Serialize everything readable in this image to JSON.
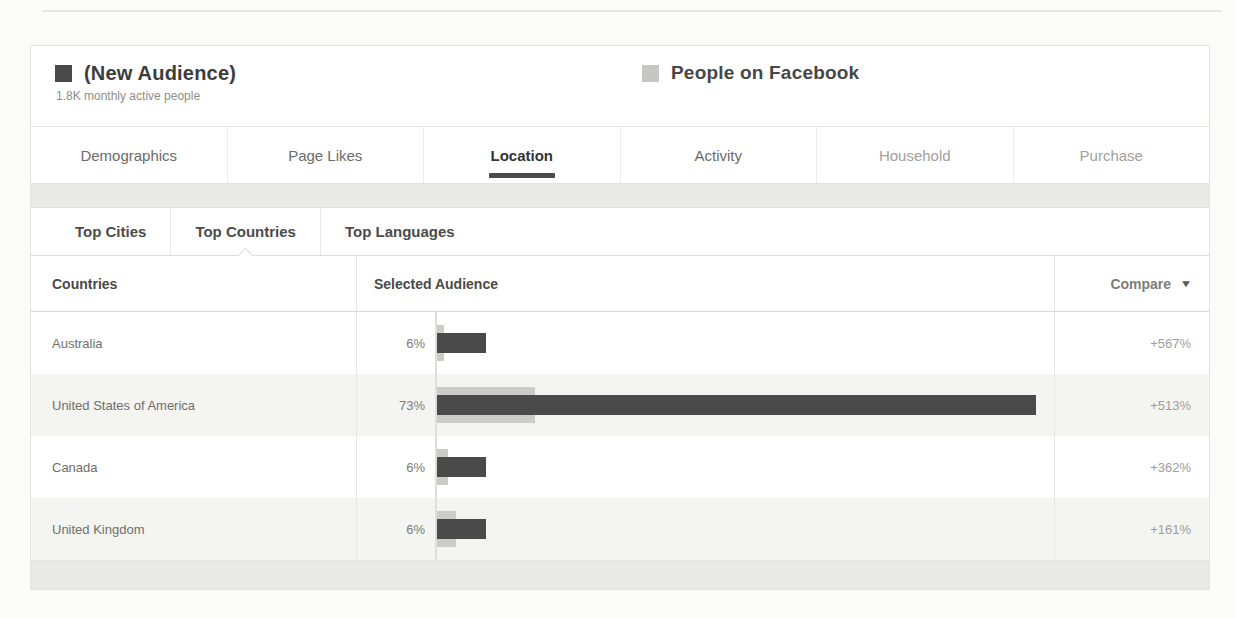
{
  "legend": {
    "audience": {
      "label": "(New Audience)",
      "sublabel": "1.8K monthly active people",
      "color": "#4a4a4a"
    },
    "facebook": {
      "label": "People on Facebook",
      "color": "#c6c6c2"
    }
  },
  "tabs": [
    {
      "label": "Demographics",
      "tone": "normal"
    },
    {
      "label": "Page Likes",
      "tone": "normal"
    },
    {
      "label": "Location",
      "tone": "active"
    },
    {
      "label": "Activity",
      "tone": "normal"
    },
    {
      "label": "Household",
      "tone": "muted"
    },
    {
      "label": "Purchase",
      "tone": "muted"
    }
  ],
  "subtabs": [
    {
      "label": "Top Cities",
      "active": false
    },
    {
      "label": "Top Countries",
      "active": true
    },
    {
      "label": "Top Languages",
      "active": false
    }
  ],
  "table": {
    "columns": {
      "country": "Countries",
      "audience": "Selected Audience",
      "compare": "Compare"
    },
    "compare_caret": "▼"
  },
  "rows": [
    {
      "country": "Australia",
      "pct_label": "6%",
      "audience_pct": 6,
      "facebook_pct": 0.9,
      "compare": "+567%"
    },
    {
      "country": "United States of America",
      "pct_label": "73%",
      "audience_pct": 73,
      "facebook_pct": 11.9,
      "compare": "+513%"
    },
    {
      "country": "Canada",
      "pct_label": "6%",
      "audience_pct": 6,
      "facebook_pct": 1.3,
      "compare": "+362%"
    },
    {
      "country": "United Kingdom",
      "pct_label": "6%",
      "audience_pct": 6,
      "facebook_pct": 2.3,
      "compare": "+161%"
    }
  ],
  "chart_data": {
    "type": "bar",
    "categories": [
      "Australia",
      "United States of America",
      "Canada",
      "United Kingdom"
    ],
    "series": [
      {
        "name": "(New Audience)",
        "values": [
          6,
          73,
          6,
          6
        ],
        "color": "#4a4a4a"
      },
      {
        "name": "People on Facebook",
        "values": [
          0.9,
          11.9,
          1.3,
          2.3
        ],
        "color": "#cbcbc7"
      }
    ],
    "value_labels": [
      "6%",
      "73%",
      "6%",
      "6%"
    ],
    "compare_labels": [
      "+567%",
      "+513%",
      "+362%",
      "+161%"
    ],
    "xlabel": "Percent of audience",
    "ylabel": "Countries",
    "xlim": [
      0,
      75
    ],
    "grid": false,
    "legend_position": "top"
  }
}
